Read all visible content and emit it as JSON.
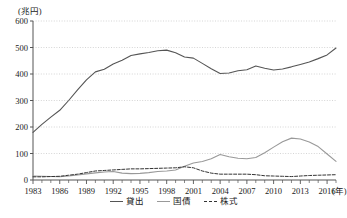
{
  "chart_data": {
    "type": "line",
    "title": "",
    "subtitle": "",
    "ylabel": "(兆円)",
    "xlabel": "(年)",
    "ylim": [
      0,
      600
    ],
    "yticks": [
      0,
      100,
      200,
      300,
      400,
      500,
      600
    ],
    "ytick_labels": [
      "0",
      "100",
      "200",
      "300",
      "400",
      "500",
      "600"
    ],
    "xlim": [
      1983,
      2017
    ],
    "xticks": [
      1983,
      1986,
      1989,
      1992,
      1995,
      1998,
      2001,
      2004,
      2007,
      2010,
      2013,
      2016
    ],
    "xtick_labels": [
      "1983",
      "1986",
      "1989",
      "1992",
      "1995",
      "1998",
      "2001",
      "2004",
      "2007",
      "2010",
      "2013",
      "2016"
    ],
    "x": [
      1983,
      1984,
      1985,
      1986,
      1987,
      1988,
      1989,
      1990,
      1991,
      1992,
      1993,
      1994,
      1995,
      1996,
      1997,
      1998,
      1999,
      2000,
      2001,
      2002,
      2003,
      2004,
      2005,
      2006,
      2007,
      2008,
      2009,
      2010,
      2011,
      2012,
      2013,
      2014,
      2015,
      2016,
      2017
    ],
    "grid": true,
    "grid_axis": "y",
    "legend_position": "bottom",
    "series": [
      {
        "name": "貸出",
        "style": "solid",
        "color": "#555555",
        "values": [
          180,
          210,
          237,
          263,
          300,
          340,
          378,
          408,
          418,
          438,
          452,
          470,
          476,
          481,
          488,
          490,
          480,
          464,
          460,
          440,
          420,
          402,
          404,
          412,
          416,
          430,
          422,
          415,
          419,
          427,
          436,
          445,
          458,
          472,
          498
        ]
      },
      {
        "name": "国債",
        "style": "solid",
        "color": "#999999",
        "values": [
          15,
          14,
          13,
          12,
          15,
          19,
          23,
          27,
          30,
          32,
          26,
          24,
          25,
          28,
          32,
          34,
          38,
          52,
          64,
          70,
          80,
          96,
          88,
          82,
          80,
          85,
          103,
          124,
          144,
          158,
          155,
          143,
          126,
          98,
          70
        ]
      },
      {
        "name": "株式",
        "style": "dashed",
        "color": "#333333",
        "values": [
          12,
          12,
          13,
          14,
          18,
          22,
          28,
          34,
          36,
          38,
          40,
          42,
          42,
          43,
          44,
          45,
          46,
          50,
          46,
          34,
          26,
          22,
          22,
          22,
          22,
          20,
          16,
          15,
          14,
          13,
          15,
          17,
          18,
          19,
          20
        ]
      }
    ]
  },
  "legend": {
    "items": [
      {
        "label": "貸出"
      },
      {
        "label": "国債"
      },
      {
        "label": "株式"
      }
    ]
  }
}
